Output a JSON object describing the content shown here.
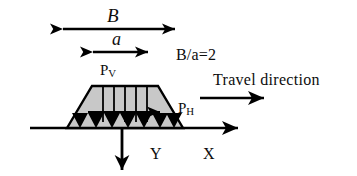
{
  "figure": {
    "background_color": "#ffffff",
    "line_color": "#000000",
    "fill_color": "#c8c8c8",
    "labels": {
      "width_B": "B",
      "width_a": "a",
      "ratio": "B/a=2",
      "travel_direction": "Travel direction",
      "vertical_load_base": "P",
      "vertical_load_sub": "V",
      "horizontal_load_base": "P",
      "horizontal_load_sub": "H",
      "axis_y": "Y",
      "axis_x": "X"
    },
    "geometry": {
      "trapezoid_base_left_x": 67,
      "trapezoid_base_right_x": 183,
      "trapezoid_top_left_x": 92,
      "trapezoid_top_right_x": 158,
      "trapezoid_top_y": 86,
      "trapezoid_base_y": 128,
      "internal_divider_count": 5,
      "base_arrow_count": 7,
      "dimension_B_start_x": 62,
      "dimension_B_end_x": 176,
      "dimension_B_y": 29,
      "dimension_a_start_x": 92,
      "dimension_a_end_x": 149,
      "dimension_a_y": 52,
      "ground_line_start_x": 30,
      "ground_line_end_x": 240,
      "ground_line_y": 128,
      "travel_arrow_start_x": 200,
      "travel_arrow_end_x": 266,
      "travel_arrow_y": 98,
      "y_axis_arrow_x": 122,
      "y_axis_arrow_end_y": 172,
      "ph_arrow_start_x": 88,
      "ph_arrow_end_x": 163,
      "ph_arrow_y": 112
    }
  }
}
